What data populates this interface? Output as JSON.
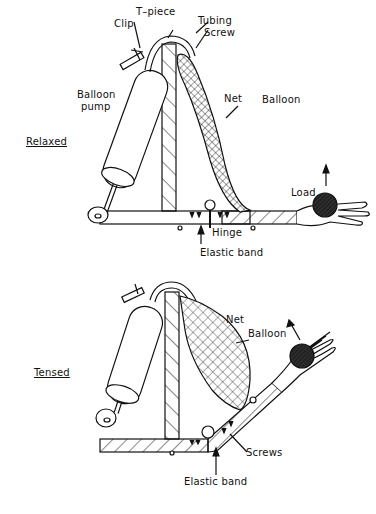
{
  "diagram": {
    "panels": [
      {
        "state_label": "Relaxed",
        "labels": {
          "t_piece": "T–piece",
          "clip": "Clip",
          "tubing": "Tubing",
          "screw": "Screw",
          "balloon_pump_line1": "Balloon",
          "balloon_pump_line2": "pump",
          "net": "Net",
          "balloon": "Balloon",
          "load": "Load",
          "hinge": "Hinge",
          "elastic_band": "Elastic band"
        }
      },
      {
        "state_label": "Tensed",
        "labels": {
          "net": "Net",
          "balloon": "Balloon",
          "screws": "Screws",
          "elastic_band": "Elastic band"
        }
      }
    ],
    "colors": {
      "ink": "#111111",
      "background": "#ffffff",
      "load_fill": "#222222"
    }
  }
}
